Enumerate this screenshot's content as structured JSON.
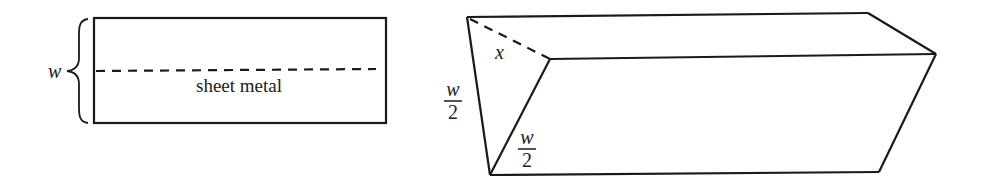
{
  "diagram": {
    "colors": {
      "stroke": "#1a1a1a",
      "background": "#ffffff"
    },
    "sheet": {
      "width_label": "w",
      "caption": "sheet metal"
    },
    "trough": {
      "fold_label": "x",
      "side_label_left": {
        "numerator": "w",
        "denominator": "2"
      },
      "side_label_inner": {
        "numerator": "w",
        "denominator": "2"
      }
    }
  }
}
